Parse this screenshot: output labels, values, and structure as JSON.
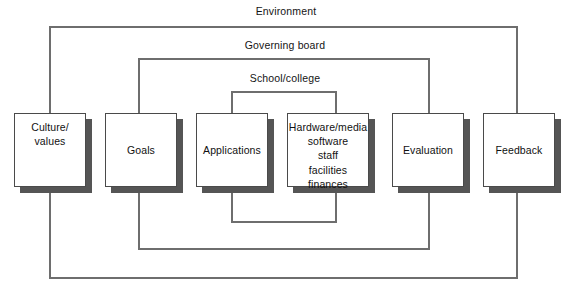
{
  "diagram": {
    "type": "nested-boundary-flow-diagram",
    "line_color": "#6e6e6e",
    "box_border_color": "#4a4a4a",
    "box_fill_color": "#ffffff",
    "box_shadow_color": "#555555",
    "text_color": "#111111",
    "background_color": "#ffffff"
  },
  "rings": [
    {
      "id": "environment",
      "label": "Environment",
      "label_x": 286,
      "label_y": 5,
      "rect": {
        "x": 50,
        "y": 27,
        "w": 467,
        "h": 251
      }
    },
    {
      "id": "governing-board",
      "label": "Governing board",
      "label_x": 285,
      "label_y": 39,
      "rect": {
        "x": 139,
        "y": 59,
        "w": 290,
        "h": 190
      }
    },
    {
      "id": "school-college",
      "label": "School/college",
      "label_x": 285,
      "label_y": 72,
      "rect": {
        "x": 232,
        "y": 92,
        "w": 104,
        "h": 130
      }
    }
  ],
  "nodes": [
    {
      "id": "culture-values",
      "label": "Culture/\nvalues",
      "x": 14,
      "y": 113,
      "w": 72,
      "h": 74,
      "multiline": true,
      "connector_x": 50
    },
    {
      "id": "goals",
      "label": "Goals",
      "x": 105,
      "y": 113,
      "w": 72,
      "h": 74,
      "multiline": false,
      "connector_x": 139
    },
    {
      "id": "applications",
      "label": "Applications",
      "x": 196,
      "y": 113,
      "w": 72,
      "h": 74,
      "multiline": false,
      "connector_x": 232
    },
    {
      "id": "hardware-media",
      "label": "Hardware/media\nsoftware\nstaff\nfacilities\nfinances",
      "x": 287,
      "y": 113,
      "w": 82,
      "h": 74,
      "multiline": true,
      "connector_x": 336
    },
    {
      "id": "evaluation",
      "label": "Evaluation",
      "x": 392,
      "y": 113,
      "w": 72,
      "h": 74,
      "multiline": false,
      "connector_x": 429
    },
    {
      "id": "feedback",
      "label": "Feedback",
      "x": 483,
      "y": 113,
      "w": 72,
      "h": 74,
      "multiline": false,
      "connector_x": 517
    }
  ],
  "connectors": {
    "environment_top_left": "M50 113 L50 27",
    "environment_top_right": "M517 113 L517 27",
    "environment_bottom_left": "M50 187 L50 278",
    "environment_bottom_right": "M517 187 L517 278",
    "governing_top_left": "M139 113 L139 59",
    "governing_top_right": "M429 113 L429 59",
    "governing_bottom_left": "M139 187 L139 249",
    "governing_bottom_right": "M429 187 L429 249",
    "school_top_left": "M232 113 L232 92",
    "school_top_right": "M336 113 L336 92",
    "school_bottom_left": "M232 187 L232 222",
    "school_bottom_right": "M336 187 L336 222"
  }
}
